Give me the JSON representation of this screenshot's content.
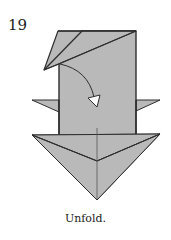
{
  "step": {
    "number": "19",
    "caption": "Unfold."
  },
  "diagram": {
    "paper_color": "#b9b9b9",
    "line_color": "#2e2e2e",
    "crease_color": "#555555",
    "arrow_fill": "#ffffff",
    "elements": [
      "folded-flap-top-left",
      "rectangular-body",
      "left-side-point",
      "right-side-point",
      "arrow-head-bottom-triangle",
      "center-crease",
      "curved-unfold-arrow"
    ]
  }
}
